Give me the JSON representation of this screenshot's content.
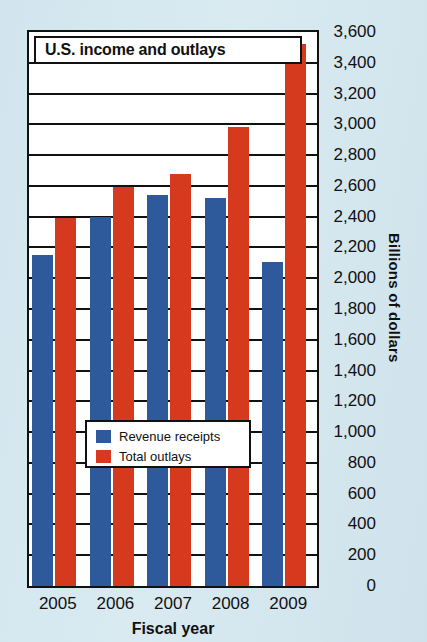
{
  "chart_data": {
    "type": "bar",
    "title": "U.S. income and outlays",
    "xlabel": "Fiscal year",
    "ylabel": "Billions of dollars",
    "categories": [
      "2005",
      "2006",
      "2007",
      "2008",
      "2009"
    ],
    "series": [
      {
        "name": "Revenue receipts",
        "color": "#2e5a9c",
        "values": [
          2150,
          2400,
          2540,
          2520,
          2105
        ]
      },
      {
        "name": "Total outlays",
        "color": "#d63a1e",
        "values": [
          2390,
          2590,
          2680,
          2980,
          3520
        ]
      }
    ],
    "ylim": [
      0,
      3600
    ],
    "ytick_step": 200,
    "yticks": [
      "3,600",
      "3,400",
      "3,200",
      "3,000",
      "2,800",
      "2,600",
      "2,400",
      "2,200",
      "2,000",
      "1,800",
      "1,600",
      "1,400",
      "1,200",
      "1,000",
      "800",
      "600",
      "400",
      "200",
      "0"
    ],
    "ytick_values": [
      3600,
      3400,
      3200,
      3000,
      2800,
      2600,
      2400,
      2200,
      2000,
      1800,
      1600,
      1400,
      1200,
      1000,
      800,
      600,
      400,
      200,
      0
    ],
    "grid": true,
    "legend_position": "inside-lower-left"
  },
  "legend": {
    "items": [
      {
        "label": "Revenue receipts",
        "color": "#2e5a9c"
      },
      {
        "label": "Total outlays",
        "color": "#d63a1e"
      }
    ]
  },
  "colors": {
    "revenue": "#2e5a9c",
    "outlays": "#d63a1e",
    "background": "#d2e5ee",
    "frame": "#111111",
    "plot_background": "#ffffff"
  }
}
